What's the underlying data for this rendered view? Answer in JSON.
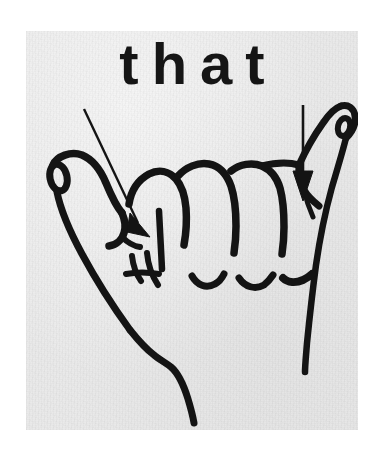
{
  "page": {
    "background_color": "#ffffff",
    "plate_background_color": "#e9e9e9",
    "ink_color": "#141414"
  },
  "illustration": {
    "caption": "that",
    "subject": "american-sign-language-handshape",
    "description_alt": "Line drawing of a hand forming the ASL sign for the word that",
    "annotations": [
      {
        "id": "left-arrow",
        "kind": "arrow",
        "direction": "down-right",
        "points_to": "thumb-and-index-contact",
        "from_x": 85,
        "from_y": 100,
        "to_x": 118,
        "to_y": 202
      },
      {
        "id": "right-arrow",
        "kind": "arrow",
        "direction": "down",
        "points_to": "pinky-base-contact",
        "from_x": 277,
        "from_y": 100,
        "to_x": 277,
        "to_y": 162
      }
    ]
  },
  "caption_style": {
    "letters": [
      "t",
      "h",
      "a",
      "t"
    ],
    "weight": "bold",
    "case": "lowercase",
    "tracking": "wide"
  }
}
